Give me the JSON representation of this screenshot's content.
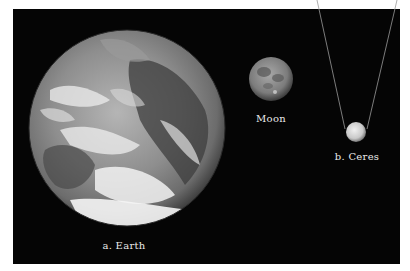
{
  "figure": {
    "background_color": "#050505",
    "page_color": "#ffffff",
    "bodies": [
      {
        "id": "earth",
        "label": "a.  Earth",
        "cx": 127,
        "cy": 128,
        "r": 98
      },
      {
        "id": "moon",
        "label": "Moon",
        "cx": 271,
        "cy": 79,
        "r": 22
      },
      {
        "id": "ceres",
        "label": "b.  Ceres",
        "cx": 356,
        "cy": 132,
        "r": 10
      }
    ],
    "callout_lines_color": "#9a9a9a"
  }
}
